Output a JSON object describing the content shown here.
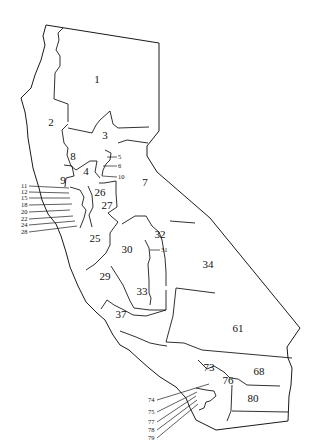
{
  "map": {
    "region": "California",
    "colors": {
      "background": "#ffffff",
      "stroke": "#1a1a1a",
      "text": "#111111"
    },
    "districts_large": [
      {
        "id": "1",
        "x": 97,
        "y": 83
      },
      {
        "id": "2",
        "x": 51,
        "y": 126
      },
      {
        "id": "3",
        "x": 105,
        "y": 139
      },
      {
        "id": "4",
        "x": 86,
        "y": 175
      },
      {
        "id": "7",
        "x": 145,
        "y": 186
      },
      {
        "id": "8",
        "x": 73,
        "y": 160
      },
      {
        "id": "9",
        "x": 63,
        "y": 184
      },
      {
        "id": "25",
        "x": 95,
        "y": 242
      },
      {
        "id": "26",
        "x": 100,
        "y": 196
      },
      {
        "id": "27",
        "x": 107,
        "y": 209
      },
      {
        "id": "29",
        "x": 105,
        "y": 280
      },
      {
        "id": "30",
        "x": 127,
        "y": 253
      },
      {
        "id": "32",
        "x": 160,
        "y": 238
      },
      {
        "id": "33",
        "x": 142,
        "y": 295
      },
      {
        "id": "34",
        "x": 208,
        "y": 268
      },
      {
        "id": "37",
        "x": 121,
        "y": 318
      },
      {
        "id": "61",
        "x": 238,
        "y": 332
      },
      {
        "id": "68",
        "x": 259,
        "y": 375
      },
      {
        "id": "73",
        "x": 209,
        "y": 371
      },
      {
        "id": "76",
        "x": 228,
        "y": 384
      },
      {
        "id": "80",
        "x": 253,
        "y": 402
      }
    ],
    "callouts_left": [
      {
        "id": "11",
        "label_x": 21,
        "label_y": 188,
        "x2": 69,
        "y2": 188
      },
      {
        "id": "12",
        "label_x": 21,
        "label_y": 194,
        "x2": 69,
        "y2": 193
      },
      {
        "id": "15",
        "label_x": 21,
        "label_y": 200,
        "x2": 70,
        "y2": 198
      },
      {
        "id": "18",
        "label_x": 21,
        "label_y": 207,
        "x2": 72,
        "y2": 204
      },
      {
        "id": "20",
        "label_x": 21,
        "label_y": 214,
        "x2": 70,
        "y2": 210
      },
      {
        "id": "22",
        "label_x": 21,
        "label_y": 221,
        "x2": 73,
        "y2": 216
      },
      {
        "id": "24",
        "label_x": 21,
        "label_y": 227,
        "x2": 75,
        "y2": 221
      },
      {
        "id": "28",
        "label_x": 21,
        "label_y": 234,
        "x2": 77,
        "y2": 226
      }
    ],
    "callouts_right": [
      {
        "id": "5",
        "label_x": 118,
        "label_y": 159,
        "x1": 107,
        "y1": 157
      },
      {
        "id": "6",
        "label_x": 118,
        "label_y": 168,
        "x1": 103,
        "y1": 166
      },
      {
        "id": "10",
        "label_x": 118,
        "label_y": 179,
        "x1": 102,
        "y1": 176
      },
      {
        "id": "31",
        "label_x": 161,
        "label_y": 252,
        "x1": 150,
        "y1": 250
      }
    ],
    "callouts_south": [
      {
        "id": "74",
        "label_x": 148,
        "label_y": 402,
        "x2": 209,
        "y2": 384
      },
      {
        "id": "75",
        "label_x": 148,
        "label_y": 414,
        "x2": 197,
        "y2": 392
      },
      {
        "id": "77",
        "label_x": 148,
        "label_y": 424,
        "x2": 196,
        "y2": 396
      },
      {
        "id": "78",
        "label_x": 148,
        "label_y": 432,
        "x2": 197,
        "y2": 400
      },
      {
        "id": "79",
        "label_x": 148,
        "label_y": 440,
        "x2": 198,
        "y2": 404
      }
    ]
  }
}
